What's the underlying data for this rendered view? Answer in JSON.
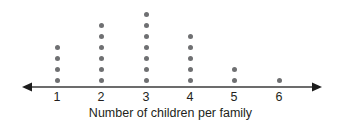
{
  "chart_data": {
    "type": "dot-plot",
    "title": "",
    "xlabel": "Number of children per family",
    "ylabel": "",
    "categories": [
      "1",
      "2",
      "3",
      "4",
      "5",
      "6"
    ],
    "values": [
      4,
      6,
      7,
      5,
      2,
      1
    ],
    "total_count": 25,
    "grid": false,
    "legend": false,
    "axis": {
      "left_arrow": true,
      "right_arrow": true,
      "tick_marks": false,
      "line_color": "#3b3b3b",
      "xlim": [
        "<1",
        ">6"
      ]
    },
    "marks": {
      "shape": "circle",
      "color": "#6f7072",
      "diameter_px": 5,
      "vertical_spacing_px": 11
    }
  },
  "geometry": {
    "column_x": [
      57,
      101,
      146,
      190,
      234,
      279
    ],
    "baseline_y": 80,
    "axis_y": 87,
    "axis_x_start": 22,
    "axis_x_end": 322
  }
}
